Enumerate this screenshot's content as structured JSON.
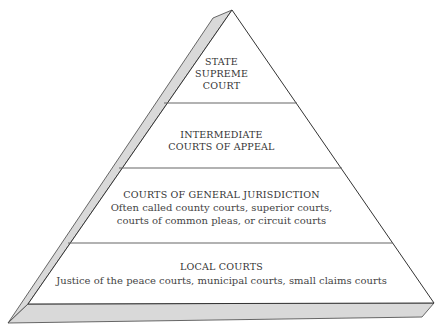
{
  "diagram": {
    "type": "pyramid",
    "colors": {
      "face": "#ffffff",
      "side": "#d9d9d9",
      "line": "#444444",
      "divider": "#666666",
      "text": "#333333"
    },
    "tiers": [
      {
        "title": "STATE\nSUPREME\nCOURT",
        "description": ""
      },
      {
        "title": "INTERMEDIATE\nCOURTS OF APPEAL",
        "description": ""
      },
      {
        "title": "COURTS OF GENERAL JURISDICTION",
        "description": "Often called county courts, superior courts,\ncourts of common pleas, or circuit courts"
      },
      {
        "title": "LOCAL COURTS",
        "description": "Justice of the peace courts, municipal courts, small claims courts"
      }
    ]
  }
}
